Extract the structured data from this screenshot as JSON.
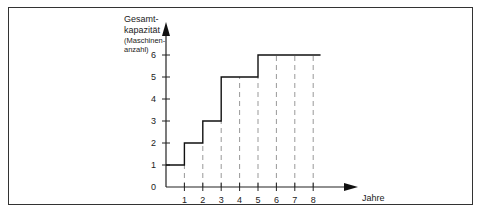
{
  "chart_data": {
    "type": "line",
    "subtype": "step",
    "title": "",
    "xlabel": "Jahre",
    "ylabel": "Gesamtkapazität (Maschinenanzahl)",
    "ylabel_lines": [
      "Gesamt-",
      "kapazität",
      "(Maschinen-",
      "anzahl)"
    ],
    "x_ticks": [
      "1",
      "2",
      "3",
      "4",
      "5",
      "6",
      "7",
      "8"
    ],
    "y_ticks": [
      "0",
      "1",
      "2",
      "3",
      "4",
      "5",
      "6"
    ],
    "xlim": [
      0,
      9
    ],
    "ylim": [
      0,
      6.5
    ],
    "grid": "vertical dashed lines at each year",
    "legend": "none",
    "series": [
      {
        "name": "Gesamtkapazität",
        "step_points": [
          {
            "x": 0,
            "y": 1
          },
          {
            "x": 1,
            "y": 2
          },
          {
            "x": 2,
            "y": 3
          },
          {
            "x": 3,
            "y": 5
          },
          {
            "x": 5,
            "y": 6
          },
          {
            "x": 8.4,
            "y": 6
          }
        ],
        "values_by_year": [
          1,
          2,
          3,
          5,
          5,
          6,
          6,
          6,
          6
        ]
      }
    ]
  }
}
